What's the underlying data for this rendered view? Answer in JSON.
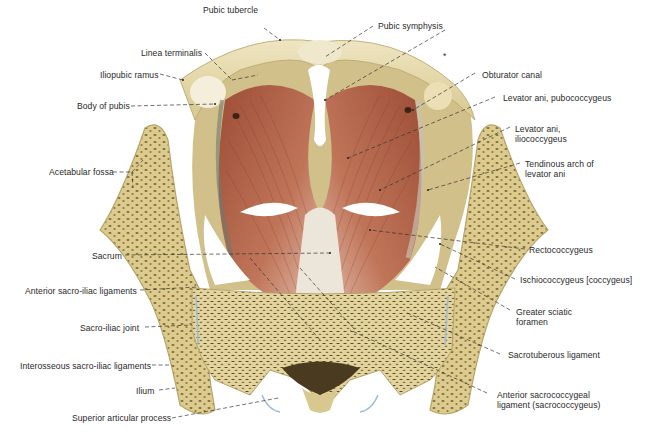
{
  "figure": {
    "colors": {
      "background": "#ffffff",
      "bone_cortical": "#e8dcae",
      "bone_spongy": "#d9c98a",
      "bone_spongy_dots": "#5a4a25",
      "muscle": "#b8664a",
      "muscle_light": "#d79a80",
      "tendon": "#e9e2d6",
      "label_text": "#2a2a2a",
      "leader_line": "#333333",
      "joint_blue": "#9fbcd6"
    }
  },
  "labels": {
    "left": [
      {
        "id": "pubic-tubercle",
        "text": "Pubic tubercle"
      },
      {
        "id": "linea-terminalis",
        "text": "Linea terminalis"
      },
      {
        "id": "iliopubic-ramus",
        "text": "Iliopubic ramus"
      },
      {
        "id": "body-of-pubis",
        "text": "Body of pubis"
      },
      {
        "id": "acetabular-fossa",
        "text": "Acetabular fossa"
      },
      {
        "id": "sacrum",
        "text": "Sacrum"
      },
      {
        "id": "anterior-sacro-iliac-ligaments",
        "text": "Anterior sacro-iliac ligaments"
      },
      {
        "id": "sacro-iliac-joint",
        "text": "Sacro-iliac joint"
      },
      {
        "id": "interosseous-sacro-iliac-ligaments",
        "text": "Interosseous sacro-iliac ligaments"
      },
      {
        "id": "ilium",
        "text": "Ilium"
      },
      {
        "id": "superior-articular-process",
        "text": "Superior articular process"
      }
    ],
    "right": [
      {
        "id": "pubic-symphysis",
        "text": "Pubic symphysis"
      },
      {
        "id": "asterisk",
        "text": "*"
      },
      {
        "id": "obturator-canal",
        "text": "Obturator canal"
      },
      {
        "id": "levator-ani-pubococcygeus",
        "text": "Levator ani, pubococcygeus"
      },
      {
        "id": "levator-ani-iliococcygeus",
        "line1": "Levator ani,",
        "line2": "iliococcygeus"
      },
      {
        "id": "tendinous-arch",
        "line1": "Tendinous arch of",
        "line2": "levator ani"
      },
      {
        "id": "rectococcygeus",
        "text": "Rectococcygeus"
      },
      {
        "id": "ischiococcygeus",
        "text": "Ischiococcygeus [coccygeus]"
      },
      {
        "id": "greater-sciatic-foramen",
        "line1": "Greater sciatic",
        "line2": "foramen"
      },
      {
        "id": "sacrotuberous-ligament",
        "text": "Sacrotuberous ligament"
      },
      {
        "id": "anterior-sacrococcygeal-ligament",
        "line1": "Anterior sacrococcygeal",
        "line2": "ligament (sacrococcygeus)"
      }
    ]
  }
}
